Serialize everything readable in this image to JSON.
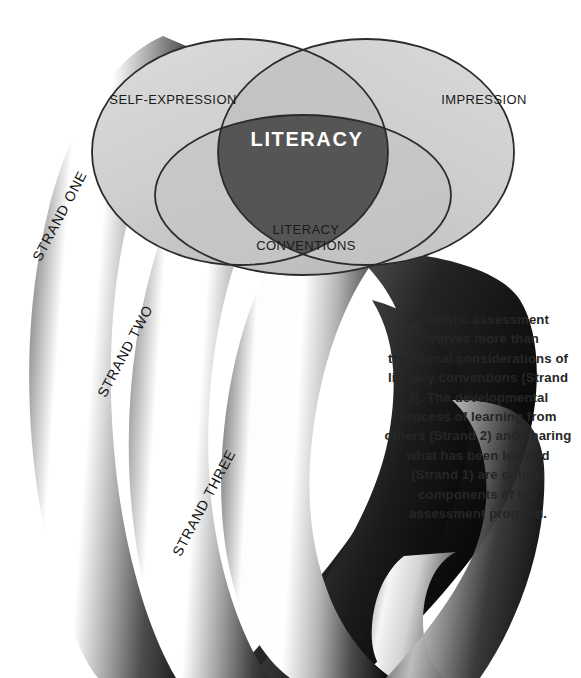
{
  "diagram": {
    "center_label": "LITERACY",
    "circles": [
      {
        "id": "self-expression",
        "label": "SELF-EXPRESSION",
        "position": "upper-left"
      },
      {
        "id": "impression",
        "label": "IMPRESSION",
        "position": "upper-right"
      },
      {
        "id": "literacy-conventions",
        "label": "LITERACY\nCONVENTIONS",
        "label_line1": "LITERACY",
        "label_line2": "CONVENTIONS",
        "position": "bottom-center"
      }
    ],
    "strands": [
      {
        "id": "strand-one",
        "label": "STRAND ONE"
      },
      {
        "id": "strand-two",
        "label": "STRAND TWO"
      },
      {
        "id": "strand-three",
        "label": "STRAND THREE"
      }
    ],
    "caption": "Authentic assessment involves more than traditional considerations of literacy conventions (Strand 3). The developmental process of learning from others (Strand 2) and sharing what has been learned (Strand 1) are critical components of the assessment program.",
    "colors": {
      "background": "#ffffff",
      "circle_fill_light": "#d6d6d6",
      "circle_fill_mid": "#c6c6c6",
      "circle_stroke": "#2b2b2b",
      "center_fill": "#555555",
      "center_text": "#ffffff",
      "label_text": "#1a1a1a",
      "caption_text": "#262626",
      "strand_dark": "#141414",
      "strand_light": "#ffffff"
    }
  }
}
